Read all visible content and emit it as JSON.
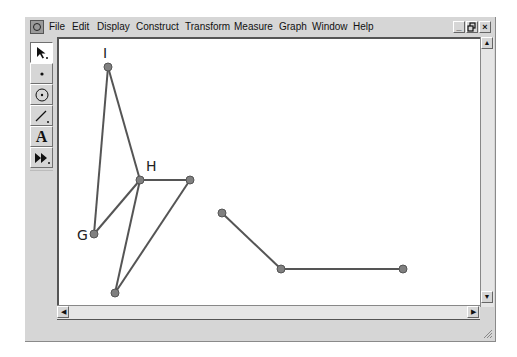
{
  "window": {
    "app_icon": "sketchpad-app-icon",
    "menu": [
      "File",
      "Edit",
      "Display",
      "Construct",
      "Transform",
      "Measure",
      "Graph",
      "Window",
      "Help"
    ],
    "controls": {
      "minimize": "_",
      "restore": "🗗",
      "close": "×"
    }
  },
  "toolbox": {
    "tools": [
      {
        "name": "selection-arrow-tool",
        "glyph": "↖",
        "active": true
      },
      {
        "name": "point-tool",
        "glyph": "•"
      },
      {
        "name": "compass-tool",
        "glyph": "⊙"
      },
      {
        "name": "straightedge-tool",
        "glyph": "/"
      },
      {
        "name": "text-tool",
        "glyph": "A"
      },
      {
        "name": "custom-tool",
        "glyph": "▶▶"
      }
    ]
  },
  "canvas": {
    "point_color": "#808080",
    "line_color": "#555555",
    "points": [
      {
        "id": "I",
        "label": "I",
        "x": 108,
        "y": 67
      },
      {
        "id": "H",
        "label": "H",
        "x": 140,
        "y": 180
      },
      {
        "id": "G",
        "label": "G",
        "x": 94,
        "y": 234
      },
      {
        "id": "P1",
        "label": "",
        "x": 190,
        "y": 180
      },
      {
        "id": "P2",
        "label": "",
        "x": 115,
        "y": 293
      },
      {
        "id": "P3",
        "label": "",
        "x": 222,
        "y": 213
      },
      {
        "id": "P4",
        "label": "",
        "x": 281,
        "y": 269
      },
      {
        "id": "P5",
        "label": "",
        "x": 403,
        "y": 269
      }
    ],
    "labels": [
      {
        "text": "I",
        "x": 103,
        "y": 58
      },
      {
        "text": "H",
        "x": 146,
        "y": 171
      },
      {
        "text": "G",
        "x": 77,
        "y": 240
      }
    ],
    "segments": [
      [
        "I",
        "H"
      ],
      [
        "I",
        "G"
      ],
      [
        "G",
        "H"
      ],
      [
        "H",
        "P1"
      ],
      [
        "H",
        "P2"
      ],
      [
        "P2",
        "P1"
      ],
      [
        "P3",
        "P4"
      ],
      [
        "P4",
        "P5"
      ]
    ]
  },
  "scrollbars": {
    "vertical": {
      "up": "▲",
      "down": "▼"
    },
    "horizontal": {
      "left": "◀",
      "right": "▶"
    }
  }
}
